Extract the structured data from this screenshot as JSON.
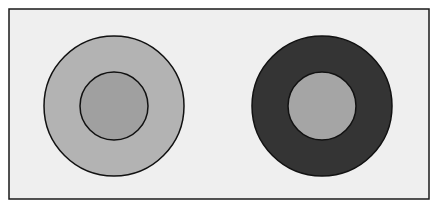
{
  "diagram": {
    "type": "simultaneous-contrast-illusion",
    "frame": {
      "x": 9,
      "y": 9,
      "width": 420,
      "height": 190,
      "fill": "#efefef",
      "stroke": "#1a1a1a"
    },
    "figures": [
      {
        "name": "left-figure",
        "center": [
          114,
          106
        ],
        "outer": {
          "r": 70,
          "fill": "#b3b3b3"
        },
        "inner": {
          "r": 34,
          "fill": "#a0a0a0"
        },
        "stroke": "#111111"
      },
      {
        "name": "right-figure",
        "center": [
          322,
          106
        ],
        "outer": {
          "r": 70,
          "fill": "#343434"
        },
        "inner": {
          "r": 34,
          "fill": "#a5a5a5"
        },
        "stroke": "#111111"
      }
    ]
  }
}
